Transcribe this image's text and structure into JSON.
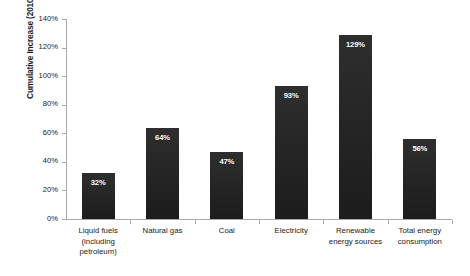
{
  "chart_data": {
    "type": "bar",
    "title": "",
    "xlabel": "",
    "ylabel": "Cumulative Increase (2010 - 2040)",
    "ylim": [
      0,
      140
    ],
    "ytick_labels": [
      "0%",
      "20%",
      "40%",
      "60%",
      "80%",
      "100%",
      "120%",
      "140%"
    ],
    "ytick_values": [
      0,
      20,
      40,
      60,
      80,
      100,
      120,
      140
    ],
    "grid": false,
    "legend": false,
    "bar_color": "#262626",
    "value_label_color": "#ffffff",
    "axis_color": "#a9a9a9",
    "categories": [
      "Liquid fuels (including petroleum)",
      "Natural gas",
      "Coal",
      "Electricity",
      "Renewable energy sources",
      "Total energy consumption"
    ],
    "category_lines": [
      [
        "Liquid fuels",
        "(including",
        "petroleum)"
      ],
      [
        "Natural gas"
      ],
      [
        "Coal"
      ],
      [
        "Electricity"
      ],
      [
        "Renewable",
        "energy sources"
      ],
      [
        "Total energy",
        "consumption"
      ]
    ],
    "values": [
      32,
      64,
      47,
      93,
      129,
      56
    ],
    "value_labels": [
      "32%",
      "64%",
      "47%",
      "93%",
      "129%",
      "56%"
    ]
  }
}
